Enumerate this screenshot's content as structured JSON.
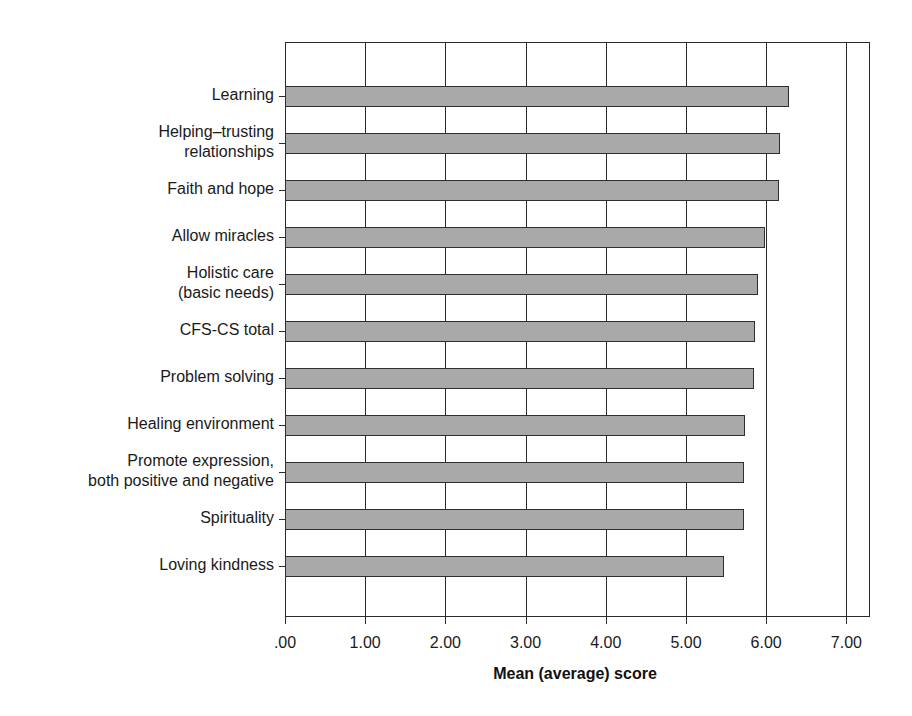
{
  "chart_data": {
    "type": "bar",
    "orientation": "horizontal",
    "title": "",
    "xlabel": "Mean (average) score",
    "ylabel": "",
    "xlim": [
      0,
      7.3
    ],
    "x_ticks": [
      ".00",
      "1.00",
      "2.00",
      "3.00",
      "4.00",
      "5.00",
      "6.00",
      "7.00"
    ],
    "grid": "vertical",
    "legend": null,
    "categories": [
      "Learning",
      "Helping–trusting relationships",
      "Faith and hope",
      "Allow miracles",
      "Holistic care (basic needs)",
      "CFS-CS total",
      "Problem solving",
      "Healing environment",
      "Promote expression, both positive and negative",
      "Spirituality",
      "Loving kindness"
    ],
    "values": [
      6.28,
      6.17,
      6.16,
      5.99,
      5.9,
      5.86,
      5.85,
      5.73,
      5.72,
      5.72,
      5.47
    ],
    "bar_color": "#a9a9a9",
    "edge_color": "#2e2e2e"
  },
  "labels": [
    "Learning",
    "Helping–trusting\nrelationships",
    "Faith and hope",
    "Allow miracles",
    "Holistic care\n(basic needs)",
    "CFS-CS total",
    "Problem solving",
    "Healing environment",
    "Promote expression,\nboth positive and negative",
    "Spirituality",
    "Loving kindness"
  ]
}
